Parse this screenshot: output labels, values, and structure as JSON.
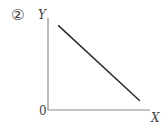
{
  "figure": {
    "number_label": "②",
    "y_axis_label": "Y",
    "x_axis_label": "X",
    "origin_label": "0"
  },
  "colors": {
    "axis": "#8a8a8a",
    "line": "#2a2a2a",
    "text": "#444444",
    "background": "#ffffff"
  },
  "chart_data": {
    "type": "line",
    "title": "②",
    "xlabel": "X",
    "ylabel": "Y",
    "origin_label": "0",
    "grid": false,
    "legend": null,
    "ticks": {
      "x": [],
      "y": []
    },
    "series": [
      {
        "name": "Y vs X",
        "x": [
          0.1,
          0.9
        ],
        "y": [
          0.92,
          0.1
        ]
      }
    ],
    "xlim": [
      0,
      1
    ],
    "ylim": [
      0,
      1
    ]
  }
}
